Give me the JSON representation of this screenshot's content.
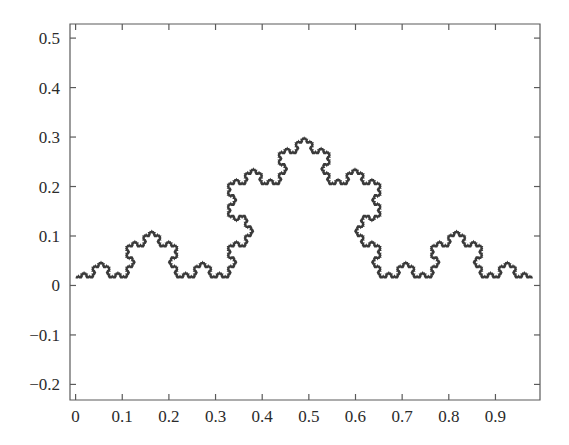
{
  "figure": {
    "background_color": "#ffffff",
    "width": 569,
    "height": 445,
    "title": "",
    "axis_color": "#5a5a5a",
    "label_color": "#2b2b2b"
  },
  "chart_data": {
    "type": "line",
    "title": "",
    "subtitle": "",
    "xlabel": "",
    "ylabel": "",
    "curve_name": "koch-curve",
    "iterations": 6,
    "baseline_y": 0.0155,
    "peak_y": 0.2895,
    "x_start": 0.0,
    "x_end": 0.98,
    "xlim": [
      -0.012,
      0.9955
    ],
    "ylim": [
      -0.2315,
      0.5285
    ],
    "grid": false,
    "legend": null,
    "legend_position": "none",
    "line_color": "#3a3a3a",
    "line_width": 1.6,
    "xticks": [
      0,
      0.1,
      0.2,
      0.3,
      0.4,
      0.5,
      0.6,
      0.7,
      0.8,
      0.9
    ],
    "xtick_labels": [
      "0",
      "0.1",
      "0.2",
      "0.3",
      "0.4",
      "0.5",
      "0.6",
      "0.7",
      "0.8",
      "0.9"
    ],
    "yticks": [
      -0.2,
      -0.1,
      0,
      0.1,
      0.2,
      0.3,
      0.4,
      0.5
    ],
    "ytick_labels": [
      "−0.2",
      "−0.1",
      "0",
      "0.1",
      "0.2",
      "0.3",
      "0.4",
      "0.5"
    ],
    "tick_direction": "in",
    "box_frame": true,
    "frame_sides": [
      "left",
      "bottom",
      "right",
      "top"
    ],
    "plot_area_px": {
      "left": 70,
      "top": 24,
      "right": 540,
      "bottom": 400
    }
  }
}
